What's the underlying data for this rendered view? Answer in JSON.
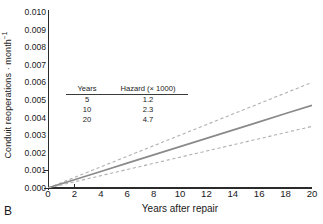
{
  "panel": {
    "letter": "B"
  },
  "axes": {
    "ylabel_text": "Conduit reoperations · month",
    "ylabel_exponent": "−1",
    "xlabel": "Years after repair",
    "yticks": [
      "0.000",
      "0.001",
      "0.002",
      "0.003",
      "0.004",
      "0.005",
      "0.006",
      "0.007",
      "0.008",
      "0.009",
      "0.010"
    ],
    "xticks": [
      "0",
      "2",
      "4",
      "6",
      "8",
      "10",
      "12",
      "14",
      "16",
      "18",
      "20"
    ]
  },
  "inset": {
    "headers": [
      "Years",
      "Hazard (× 1000)"
    ],
    "rows": [
      {
        "years": "5",
        "hazard": "1.2"
      },
      {
        "years": "10",
        "hazard": "2.3"
      },
      {
        "years": "20",
        "hazard": "4.7"
      }
    ]
  },
  "colors": {
    "line": "#8a8a8a",
    "ci": "#b0b0b0",
    "axis": "#2a2a2a",
    "text": "#1a1a1a"
  },
  "chart_data": {
    "type": "line",
    "title": "",
    "xlabel": "Years after repair",
    "ylabel": "Conduit reoperations · month⁻¹",
    "xlim": [
      0,
      20
    ],
    "ylim": [
      0.0,
      0.01
    ],
    "grid": false,
    "legend": "none",
    "x": [
      0,
      2,
      4,
      6,
      8,
      10,
      12,
      14,
      16,
      18,
      20
    ],
    "series": [
      {
        "name": "Upper 95% confidence limit",
        "style": "dashed",
        "color": "#b0b0b0",
        "values": [
          0.0,
          0.0006,
          0.0012,
          0.0018,
          0.0024,
          0.003,
          0.0036,
          0.0042,
          0.0048,
          0.0054,
          0.006
        ]
      },
      {
        "name": "Parametric hazard estimate",
        "style": "solid",
        "color": "#8a8a8a",
        "values": [
          0.0,
          0.00047,
          0.00094,
          0.00141,
          0.00188,
          0.00235,
          0.00282,
          0.00329,
          0.00376,
          0.00423,
          0.0047
        ]
      },
      {
        "name": "Lower 95% confidence limit",
        "style": "dashed",
        "color": "#b0b0b0",
        "values": [
          0.0,
          0.00035,
          0.0007,
          0.00105,
          0.0014,
          0.00175,
          0.0021,
          0.00245,
          0.0028,
          0.00315,
          0.0035
        ]
      }
    ],
    "annotations": {
      "table": {
        "headers": [
          "Years",
          "Hazard (× 1000)"
        ],
        "rows": [
          [
            "5",
            "1.2"
          ],
          [
            "10",
            "2.3"
          ],
          [
            "20",
            "4.7"
          ]
        ]
      },
      "panel_label": "B"
    }
  }
}
